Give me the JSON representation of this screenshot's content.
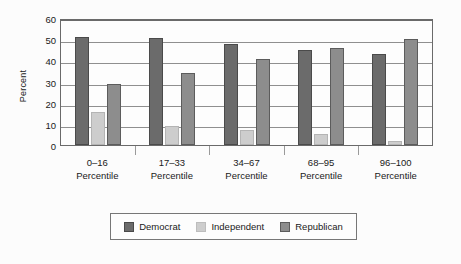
{
  "chart_data": {
    "type": "bar",
    "title": "",
    "xlabel": "",
    "ylabel": "Percent",
    "ylim": [
      0,
      60
    ],
    "yticks": [
      0,
      10,
      20,
      30,
      40,
      50,
      60
    ],
    "grid": true,
    "legend_position": "bottom",
    "categories": [
      "0–16\nPercentile",
      "17–33\nPercentile",
      "34–67\nPercentile",
      "68–95\nPercentile",
      "96–100\nPercentile"
    ],
    "category_lines": [
      {
        "line1": "0–16",
        "line2": "Percentile"
      },
      {
        "line1": "17–33",
        "line2": "Percentile"
      },
      {
        "line1": "34–67",
        "line2": "Percentile"
      },
      {
        "line1": "68–95",
        "line2": "Percentile"
      },
      {
        "line1": "96–100",
        "line2": "Percentile"
      }
    ],
    "series": [
      {
        "name": "Democrat",
        "color": "#6b6b6b",
        "values": [
          51,
          50.5,
          47.5,
          45,
          43
        ]
      },
      {
        "name": "Independent",
        "color": "#cdcdcd",
        "values": [
          15.5,
          9,
          7,
          5,
          2
        ]
      },
      {
        "name": "Republican",
        "color": "#8d8d8d",
        "values": [
          29,
          34,
          40.5,
          46,
          50
        ]
      }
    ]
  },
  "axis": {
    "y_title": "Percent",
    "y_tick_labels": [
      "60",
      "50",
      "40",
      "30",
      "20",
      "10",
      "0"
    ]
  },
  "legend": {
    "items": [
      {
        "label": "Democrat",
        "swatch": "democrat"
      },
      {
        "label": "Independent",
        "swatch": "independent"
      },
      {
        "label": "Republican",
        "swatch": "republican"
      }
    ]
  }
}
